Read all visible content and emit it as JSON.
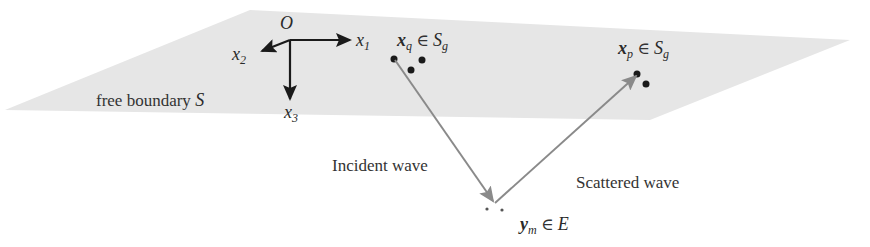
{
  "figure": {
    "plane": {
      "label": "free boundary S",
      "label_text": "free boundary ",
      "label_symbol": "S",
      "fill_color": "#e6e6e6",
      "corners": [
        [
          250,
          10
        ],
        [
          850,
          40
        ],
        [
          650,
          120
        ],
        [
          5,
          110
        ]
      ]
    },
    "axes": {
      "origin_label": "O",
      "x1_label": "x",
      "x1_sub": "1",
      "x2_label": "x",
      "x2_sub": "2",
      "x3_label": "x",
      "x3_sub": "3",
      "origin": [
        290,
        40
      ],
      "color": "#1a1a1a"
    },
    "points": {
      "xq_label": "x",
      "xq_sub": "q",
      "xq_in": " ∈ ",
      "xq_set": "S",
      "xq_set_sub": "g",
      "xp_label": "x",
      "xp_sub": "p",
      "xp_in": " ∈ ",
      "xp_set": "S",
      "xp_set_sub": "g",
      "ym_label": "y",
      "ym_sub": "m",
      "ym_in": " ∈ ",
      "ym_set": "E"
    },
    "waves": {
      "incident_label": "Incident wave",
      "scattered_label": "Scattered wave",
      "arrow_color": "#8a8a8a"
    }
  }
}
